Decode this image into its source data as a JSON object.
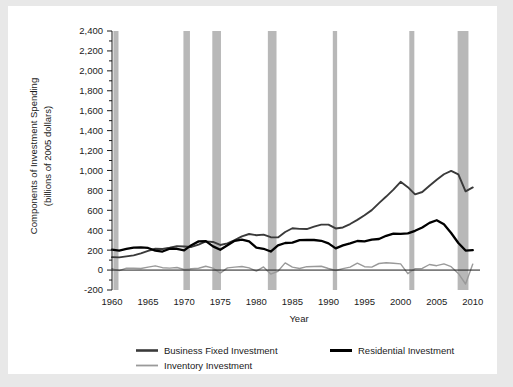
{
  "chart_data": {
    "type": "line",
    "title": "",
    "xlabel": "Year",
    "ylabel": "Components of Investment Spending\n(billions of 2005 dollars)",
    "ylabel_line1": "Components of Investment Spending",
    "ylabel_line2": "(billions of 2005 dollars)",
    "xlim": [
      1960,
      2011
    ],
    "ylim": [
      -200,
      2400
    ],
    "ytick_step": 200,
    "yticks": [
      -200,
      0,
      200,
      400,
      600,
      800,
      1000,
      1200,
      1400,
      1600,
      1800,
      2000,
      2200,
      2400
    ],
    "ytick_labels": [
      "-200",
      "0",
      "200",
      "400",
      "600",
      "800",
      "1,000",
      "1,200",
      "1,400",
      "1,600",
      "1,800",
      "2,000",
      "2,200",
      "2,400"
    ],
    "xticks": [
      1960,
      1965,
      1970,
      1975,
      1980,
      1985,
      1990,
      1995,
      2000,
      2005,
      2010
    ],
    "xtick_labels": [
      "1960",
      "1965",
      "1970",
      "1975",
      "1980",
      "1985",
      "1990",
      "1995",
      "2000",
      "2005",
      "2010"
    ],
    "grid": false,
    "legend_position": "bottom",
    "minor_ticks": true,
    "zero_line": true,
    "colors": {
      "business_fixed": "#3a3a3a",
      "residential": "#000000",
      "inventory": "#9a9a9a",
      "recession_band": "#b8b8b8",
      "axis": "#1a1a1a",
      "card_background": "#ffffff",
      "page_background": "#e8e8e8"
    },
    "recession_bands": [
      {
        "start": 1960.2,
        "end": 1960.9
      },
      {
        "start": 1969.9,
        "end": 1970.8
      },
      {
        "start": 1973.9,
        "end": 1975.1
      },
      {
        "start": 1981.6,
        "end": 1982.8
      },
      {
        "start": 1990.6,
        "end": 1991.2
      },
      {
        "start": 2001.2,
        "end": 2001.9
      },
      {
        "start": 2007.9,
        "end": 2009.4
      }
    ],
    "series": [
      {
        "name": "Business Fixed Investment",
        "color": "#3a3a3a",
        "width": 1.9,
        "x": [
          1960,
          1961,
          1962,
          1963,
          1964,
          1965,
          1966,
          1967,
          1968,
          1969,
          1970,
          1971,
          1972,
          1973,
          1974,
          1975,
          1976,
          1977,
          1978,
          1979,
          1980,
          1981,
          1982,
          1983,
          1984,
          1985,
          1986,
          1987,
          1988,
          1989,
          1990,
          1991,
          1992,
          1993,
          1994,
          1995,
          1996,
          1997,
          1998,
          1999,
          2000,
          2001,
          2002,
          2003,
          2004,
          2005,
          2006,
          2007,
          2008,
          2009,
          2010
        ],
        "values": [
          130,
          128,
          138,
          148,
          168,
          192,
          214,
          212,
          224,
          240,
          236,
          232,
          256,
          288,
          282,
          252,
          268,
          300,
          338,
          362,
          350,
          356,
          330,
          328,
          382,
          420,
          414,
          412,
          436,
          456,
          456,
          418,
          428,
          462,
          504,
          550,
          602,
          672,
          738,
          808,
          886,
          832,
          760,
          784,
          846,
          906,
          962,
          996,
          960,
          790,
          830
        ]
      },
      {
        "name": "Residential Investment",
        "color": "#000000",
        "width": 2.3,
        "x": [
          1960,
          1961,
          1962,
          1963,
          1964,
          1965,
          1966,
          1967,
          1968,
          1969,
          1970,
          1971,
          1972,
          1973,
          1974,
          1975,
          1976,
          1977,
          1978,
          1979,
          1980,
          1981,
          1982,
          1983,
          1984,
          1985,
          1986,
          1987,
          1988,
          1989,
          1990,
          1991,
          1992,
          1993,
          1994,
          1995,
          1996,
          1997,
          1998,
          1999,
          2000,
          2001,
          2002,
          2003,
          2004,
          2005,
          2006,
          2007,
          2008,
          2009,
          2010
        ],
        "values": [
          205,
          196,
          212,
          226,
          228,
          222,
          196,
          186,
          214,
          214,
          198,
          250,
          288,
          290,
          238,
          204,
          250,
          294,
          306,
          288,
          226,
          214,
          186,
          248,
          272,
          276,
          300,
          304,
          302,
          294,
          268,
          218,
          248,
          268,
          292,
          288,
          306,
          312,
          344,
          366,
          364,
          368,
          394,
          428,
          474,
          500,
          460,
          372,
          272,
          196,
          200
        ]
      },
      {
        "name": "Inventory Investment",
        "color": "#9a9a9a",
        "width": 1.4,
        "x": [
          1960,
          1961,
          1962,
          1963,
          1964,
          1965,
          1966,
          1967,
          1968,
          1969,
          1970,
          1971,
          1972,
          1973,
          1974,
          1975,
          1976,
          1977,
          1978,
          1979,
          1980,
          1981,
          1982,
          1983,
          1984,
          1985,
          1986,
          1987,
          1988,
          1989,
          1990,
          1991,
          1992,
          1993,
          1994,
          1995,
          1996,
          1997,
          1998,
          1999,
          2000,
          2001,
          2002,
          2003,
          2004,
          2005,
          2006,
          2007,
          2008,
          2009,
          2010
        ],
        "values": [
          14,
          -6,
          20,
          18,
          16,
          30,
          42,
          24,
          20,
          26,
          6,
          14,
          18,
          38,
          20,
          -30,
          22,
          30,
          36,
          22,
          -10,
          32,
          -40,
          -12,
          72,
          30,
          16,
          34,
          36,
          38,
          16,
          -4,
          14,
          30,
          70,
          34,
          30,
          66,
          74,
          68,
          62,
          -36,
          14,
          16,
          56,
          44,
          62,
          34,
          -34,
          -140,
          60
        ]
      }
    ],
    "legend": [
      {
        "label": "Business Fixed Investment",
        "color": "#3a3a3a",
        "width": 2.6
      },
      {
        "label": "Residential Investment",
        "color": "#000000",
        "width": 3.0
      },
      {
        "label": "Inventory Investment",
        "color": "#9a9a9a",
        "width": 1.8
      }
    ]
  }
}
